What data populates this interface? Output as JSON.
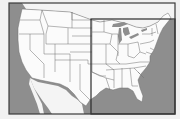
{
  "map": {
    "subject": "Contiguous United States with state boundaries",
    "colors": {
      "page_background": "#f1f1f1",
      "water": "#8e8e8e",
      "land": "#fbfbfb",
      "state_border": "#6e6e6e",
      "frame_border": "#3a3a3a",
      "highlight_border": "#2a2a2a"
    },
    "frame": {
      "x": 9,
      "y": 3,
      "width": 166,
      "height": 111
    },
    "highlight_region": {
      "label": "Eastern United States",
      "x": 91,
      "y": 19,
      "width": 84,
      "height": 95
    }
  }
}
